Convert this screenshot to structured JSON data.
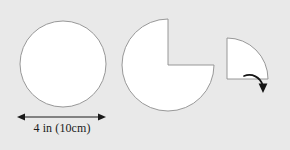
{
  "figure": {
    "background_color": "#e9e9e9",
    "shape_fill_color": "#ffffff",
    "shape_stroke_color": "#8d8d8d",
    "annotation_color": "#1a1a1a",
    "title": "",
    "shapes": [
      {
        "id": "full-circle",
        "name": "circle",
        "description": "whole circle",
        "center_x": 63,
        "center_y": 64,
        "radius": 43,
        "sweep_degrees": 360
      },
      {
        "id": "three-quarter-circle",
        "name": "three-quarter circle",
        "description": "circle with a quarter sector removed from the upper right",
        "center_x": 168,
        "center_y": 65,
        "radius": 46,
        "sweep_degrees": 270,
        "removed_sector_degrees": 90
      },
      {
        "id": "quarter-sector",
        "name": "quarter circle sector",
        "description": "the removed quarter sector shown separately",
        "corner_x": 227,
        "corner_y": 79,
        "radius": 41,
        "sweep_degrees": 90
      }
    ],
    "dimension": {
      "id": "diameter-dimension",
      "label": "4 in (10cm)",
      "value_imperial": "4 in",
      "value_metric": "10cm",
      "measures": "diameter",
      "line_y": 117,
      "line_x_start": 18,
      "line_x_end": 105,
      "arrow_style": "double-headed"
    },
    "rotation_arrow": {
      "id": "rotation-arrow",
      "description": "curved arrow pointing downward from the quarter sector",
      "direction": "clockwise-down"
    }
  }
}
